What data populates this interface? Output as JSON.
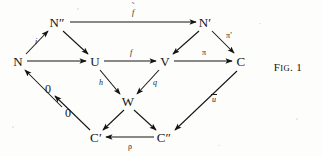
{
  "figure": {
    "caption_prefix": "F",
    "caption_small": "IG",
    "caption_suffix": ". 1",
    "caption_full": "FIG. 1",
    "type": "commutative-diagram",
    "ink_color": "#141414",
    "paper_color": "#fdfdfb"
  },
  "nodes": [
    {
      "id": "Nbis",
      "label": "N″",
      "x": 57,
      "y": 22
    },
    {
      "id": "Nprime",
      "label": "N′",
      "x": 205,
      "y": 22
    },
    {
      "id": "N",
      "label": "N",
      "x": 18,
      "y": 61
    },
    {
      "id": "U",
      "label": "U",
      "x": 95,
      "y": 61
    },
    {
      "id": "V",
      "label": "V",
      "x": 165,
      "y": 61
    },
    {
      "id": "C",
      "label": "C",
      "x": 241,
      "y": 61
    },
    {
      "id": "W",
      "label": "W",
      "x": 128,
      "y": 101
    },
    {
      "id": "zeroA",
      "label": "0",
      "x": 48,
      "y": 89
    },
    {
      "id": "zeroB",
      "label": "0",
      "x": 68,
      "y": 113
    },
    {
      "id": "Cprime",
      "label": "C′",
      "x": 96,
      "y": 137
    },
    {
      "id": "Cbis",
      "label": "C″",
      "x": 164,
      "y": 137
    }
  ],
  "edges": [
    {
      "id": "e-Nbis-Nprime",
      "from": "N″",
      "to": "N′",
      "label": "f",
      "label_accent": "tilde"
    },
    {
      "id": "e-N-Nbis",
      "from": "N",
      "to": "N″",
      "label": "i",
      "label_accent": "none"
    },
    {
      "id": "e-Nbis-U",
      "from": "N″",
      "to": "U",
      "label": "",
      "label_accent": "none"
    },
    {
      "id": "e-N-U",
      "from": "N",
      "to": "U",
      "label": "",
      "label_accent": "none"
    },
    {
      "id": "e-U-V",
      "from": "U",
      "to": "V",
      "label": "f",
      "label_accent": "none"
    },
    {
      "id": "e-Nprime-V",
      "from": "N′",
      "to": "V",
      "label": "",
      "label_accent": "none"
    },
    {
      "id": "e-Nprime-C",
      "from": "N′",
      "to": "C",
      "label": "π′",
      "label_accent": "none"
    },
    {
      "id": "e-V-C",
      "from": "V",
      "to": "C",
      "label": "π",
      "label_accent": "none"
    },
    {
      "id": "e-U-W",
      "from": "U",
      "to": "W",
      "label": "h",
      "label_accent": "none"
    },
    {
      "id": "e-V-W",
      "from": "V",
      "to": "W",
      "label": "q",
      "label_accent": "none"
    },
    {
      "id": "e-zeroB-N",
      "from": "0",
      "to": "N",
      "label": "",
      "label_accent": "none"
    },
    {
      "id": "e-Cprime-zeroA",
      "from": "C′",
      "to": "0",
      "label": "",
      "label_accent": "none"
    },
    {
      "id": "e-W-Cprime",
      "from": "W",
      "to": "C′",
      "label": "",
      "label_accent": "none"
    },
    {
      "id": "e-W-Cbis",
      "from": "W",
      "to": "C″",
      "label": "",
      "label_accent": "none"
    },
    {
      "id": "e-Cbis-Cprime",
      "from": "C″",
      "to": "C′",
      "label": "ρ",
      "label_accent": "none"
    },
    {
      "id": "e-C-Cbis",
      "from": "C",
      "to": "C″",
      "label": "u",
      "label_accent": "bar"
    }
  ],
  "labels": {
    "f_tilde": "f",
    "f_tilde_accent": "˜",
    "i": "i",
    "f": "f",
    "pi": "π",
    "pi_prime": "π′",
    "h": "h",
    "q": "q",
    "rho": "ρ",
    "u_bar": "u"
  }
}
